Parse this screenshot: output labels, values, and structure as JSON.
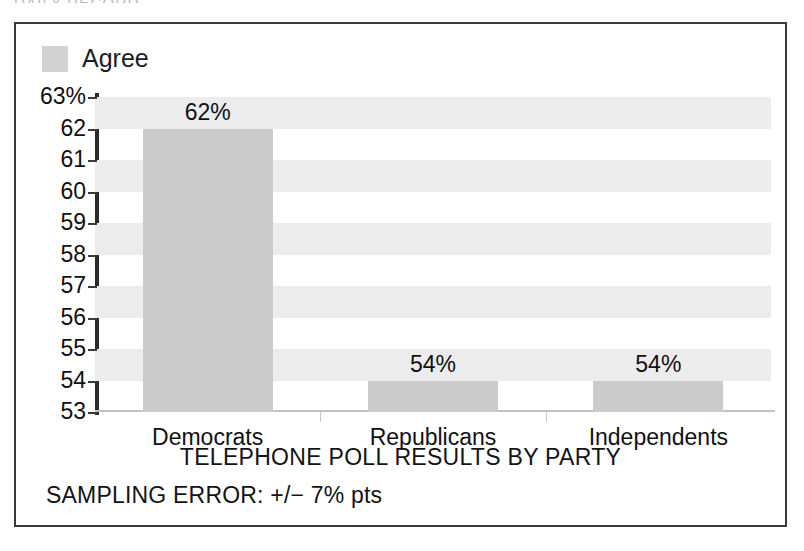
{
  "clipped_header": {
    "text": "DAILY RECORD"
  },
  "legend": {
    "swatch_color": "#d2d2d2",
    "entries": [
      {
        "label": "Agree"
      }
    ]
  },
  "axis_title": "TELEPHONE POLL RESULTS BY PARTY",
  "footnote": "SAMPLING ERROR: +/− 7% pts",
  "chart_data": {
    "type": "bar",
    "title": "",
    "subtitle": "",
    "xlabel": "TELEPHONE POLL RESULTS BY PARTY",
    "ylabel": "",
    "categories": [
      "Democrats",
      "Republicans",
      "Independents"
    ],
    "values": [
      62,
      54,
      54
    ],
    "data_labels": [
      "62%",
      "54%",
      "54%"
    ],
    "series": [
      {
        "name": "Agree",
        "values": [
          62,
          54,
          54
        ],
        "color": "#cbcbcb"
      }
    ],
    "ylim": [
      53,
      63
    ],
    "ytick_values": [
      63,
      62,
      61,
      60,
      59,
      58,
      57,
      56,
      55,
      54,
      53
    ],
    "ytick_labels": [
      "63%",
      "62",
      "61",
      "60",
      "59",
      "58",
      "57",
      "56",
      "55",
      "54",
      "53"
    ],
    "grid": false,
    "alternating_bands": true,
    "band_color": "#ececec",
    "legend_position": "top-left",
    "annotations": [
      "SAMPLING ERROR: +/− 7% pts"
    ]
  }
}
